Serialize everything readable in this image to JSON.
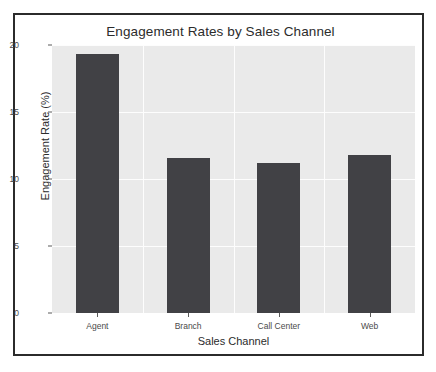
{
  "chart_data": {
    "type": "bar",
    "title": "Engagement Rates by Sales Channel",
    "xlabel": "Sales Channel",
    "ylabel": "Engagement Rate (%)",
    "categories": [
      "Agent",
      "Branch",
      "Call Center",
      "Web"
    ],
    "values": [
      19.3,
      11.6,
      11.2,
      11.8
    ],
    "ylim": [
      0,
      20
    ],
    "yticks": [
      0,
      5,
      10,
      15,
      20
    ],
    "ytick_labels": [
      "0",
      "5",
      "10",
      "15",
      "20"
    ],
    "grid": true,
    "grid_color": "#fdfdfd",
    "legend": null,
    "bar_color": "#414145",
    "plot_background": "#eaeaea",
    "figure_background": "#ffffff",
    "frame_color": "#2b2b2b"
  }
}
